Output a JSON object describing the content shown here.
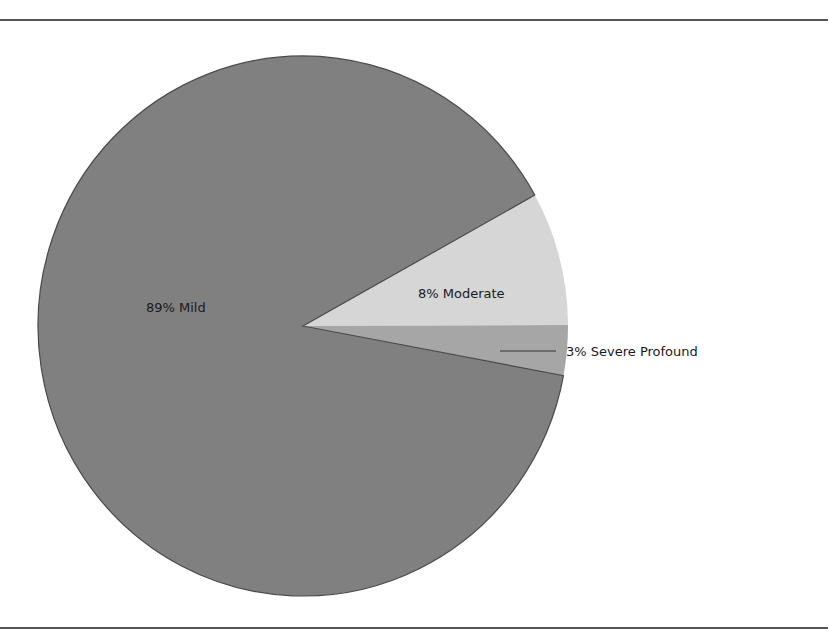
{
  "chart_data": {
    "type": "pie",
    "title": "",
    "categories": [
      "Mild",
      "Moderate",
      "Severe Profound"
    ],
    "values": [
      89,
      8,
      3
    ],
    "unit": "%",
    "labels": [
      "89% Mild",
      "8% Moderate",
      "3% Severe Profound"
    ],
    "colors": [
      "#808080",
      "#d6d6d6",
      "#a6a6a6"
    ],
    "legend": "none",
    "label_positions": {
      "Mild": "inside",
      "Moderate": "inside",
      "Severe Profound": "outside-with-leader-line"
    },
    "start_angle_deg": 29,
    "direction": "clockwise-from-moderate"
  },
  "labels": {
    "mild": "89% Mild",
    "moderate": "8% Moderate",
    "severe": "3% Severe Profound"
  },
  "caption": {
    "text": "",
    "truncated": true
  }
}
